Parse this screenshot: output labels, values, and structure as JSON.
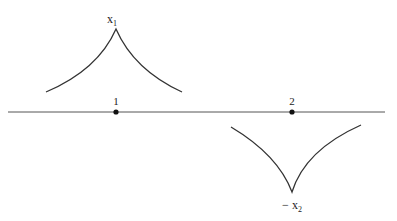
{
  "diagram": {
    "axis": {
      "x1": 8,
      "x2": 385,
      "y": 112,
      "color": "#555555"
    },
    "points": [
      {
        "label": "1",
        "x": 116,
        "y": 112
      },
      {
        "label": "2",
        "x": 292,
        "y": 112
      }
    ],
    "peaks": [
      {
        "label": "x",
        "subscript": "1",
        "prefix": "",
        "cusp_x": 116,
        "cusp_y": 29,
        "left": [
          46,
          92
        ],
        "right": [
          182,
          92
        ],
        "direction": "up"
      },
      {
        "label": "x",
        "subscript": "2",
        "prefix": "−",
        "cusp_x": 292,
        "cusp_y": 192,
        "left": [
          231,
          127
        ],
        "right": [
          361,
          125
        ],
        "direction": "down"
      }
    ],
    "stroke_color": "#333333"
  }
}
